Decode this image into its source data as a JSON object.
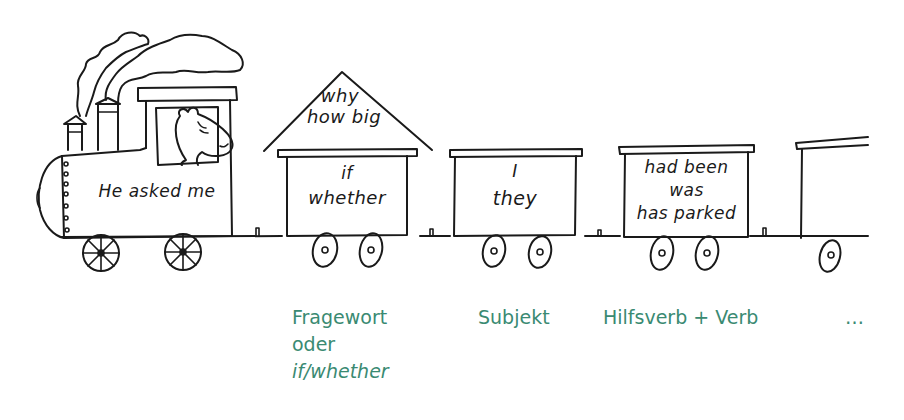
{
  "colors": {
    "ink": "#1a1a1a",
    "label_green": "#3a8a72",
    "background": "#ffffff"
  },
  "train": {
    "locomotive": {
      "text": "He asked me",
      "icon": "steam-locomotive-with-hippo-driver"
    },
    "wagons": [
      {
        "roof_text_line1": "why",
        "roof_text_line2": "how big",
        "lines": [
          "if",
          "whether"
        ]
      },
      {
        "lines": [
          "I",
          "they"
        ]
      },
      {
        "lines": [
          "had been",
          "was",
          "has parked"
        ]
      },
      {
        "lines": []
      }
    ]
  },
  "labels": [
    {
      "lines": [
        "Fragewort",
        "oder"
      ],
      "italic_line": "if/whether"
    },
    {
      "lines": [
        "Subjekt"
      ]
    },
    {
      "lines": [
        "Hilfsverb + Verb"
      ]
    },
    {
      "lines": [
        "…"
      ]
    }
  ]
}
